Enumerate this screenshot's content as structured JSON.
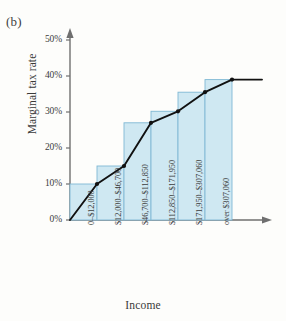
{
  "figure": {
    "panel_label": "(b)"
  },
  "chart_data": {
    "type": "bar",
    "title": "",
    "xlabel": "Income",
    "ylabel": "Marginal tax rate",
    "categories": [
      "0–$12,000",
      "$12,000–$46,700",
      "$46,700–$112,850",
      "$112,850–$171,950",
      "$171,950–$307,060",
      "over $307,060"
    ],
    "values": [
      10,
      15,
      27,
      30.2,
      35.5,
      39
    ],
    "value_labels": [
      "10%",
      "15%",
      "27%",
      "30.2%",
      "35.5%",
      "39%"
    ],
    "ylim": [
      0,
      55
    ],
    "yticks": [
      0,
      10,
      20,
      30,
      40,
      50
    ],
    "ytick_labels": [
      "0%",
      "10%",
      "20%",
      "30%",
      "40%",
      "50%"
    ],
    "grid": false,
    "legend": "none",
    "series": [
      {
        "name": "Marginal tax rate (step bars)",
        "kind": "bar",
        "values": [
          10,
          15,
          27,
          30.2,
          35.5,
          39
        ]
      },
      {
        "name": "Marginal tax rate (connecting line)",
        "kind": "line",
        "points": [
          {
            "x": 0,
            "y": 0
          },
          {
            "x": 1,
            "y": 10
          },
          {
            "x": 2,
            "y": 15
          },
          {
            "x": 3,
            "y": 27
          },
          {
            "x": 4,
            "y": 30.2
          },
          {
            "x": 5,
            "y": 35.5
          },
          {
            "x": 6,
            "y": 39
          },
          {
            "x": 7,
            "y": 39
          }
        ],
        "marker": "filled-circle",
        "extends_flat_past_last_bar": true
      }
    ],
    "colors": {
      "bar_fill": "#cfe8f2",
      "bar_stroke": "#7fb8d4",
      "line": "#111111",
      "marker": "#111111",
      "axis": "#6f6f6f",
      "text": "#3a3a3a"
    }
  }
}
